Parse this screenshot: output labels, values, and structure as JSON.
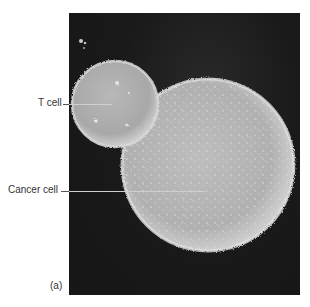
{
  "figure": {
    "panel_label": "(a)",
    "labels": [
      {
        "text": "T cell"
      },
      {
        "text": "Cancer cell"
      }
    ]
  },
  "colors": {
    "background": "#ffffff",
    "photo_bg": "#1a1a1a",
    "cell_surface": "#b9b9b9",
    "label_text": "#333333"
  }
}
